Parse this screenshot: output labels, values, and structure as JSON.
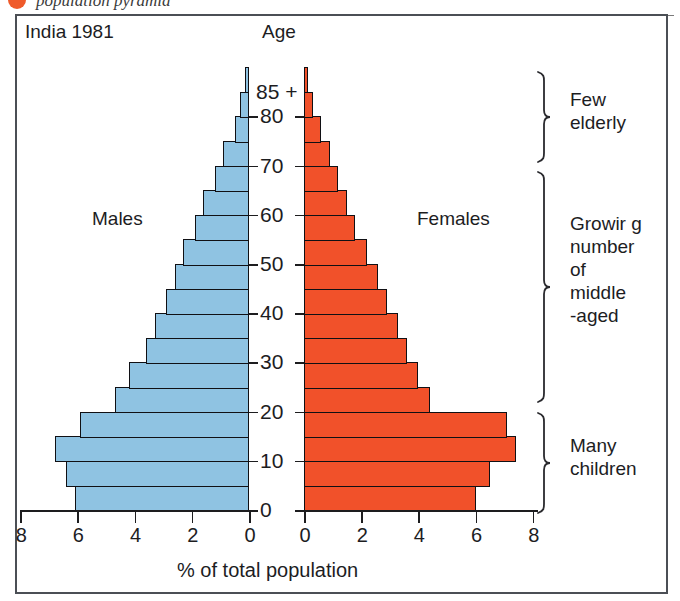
{
  "top_caption": {
    "text": "population pyramid",
    "bullet_icon": "orange-circle-bullet"
  },
  "figure": {
    "title_left": "India 1981",
    "age_axis_title": "Age",
    "left_series_label": "Males",
    "right_series_label": "Females",
    "x_axis_title": "% of total population"
  },
  "annotations": [
    {
      "id": "few-elderly",
      "text": "Few\nelderly"
    },
    {
      "id": "growing-middle-aged",
      "text": "Growir g\nnumber\nof\nmiddle\n-aged"
    },
    {
      "id": "many-children",
      "text": "Many\nchildren"
    }
  ],
  "colors": {
    "male_fill": "#8fc3e2",
    "female_fill": "#f1512a",
    "outline": "#101014",
    "frame": "#4b4f55",
    "bullet": "#ef5a2a"
  },
  "chart_data": {
    "type": "bar",
    "subtype": "population-pyramid",
    "title": "India 1981",
    "xlabel": "% of total population",
    "ylabel": "Age",
    "xlim_left": [
      8,
      0
    ],
    "xlim_right": [
      0,
      8
    ],
    "x_ticks_left": [
      "8",
      "6",
      "4",
      "2",
      "0"
    ],
    "x_ticks_right": [
      "0",
      "2",
      "4",
      "6",
      "8"
    ],
    "y_tick_labels": [
      "0",
      "10",
      "20",
      "30",
      "40",
      "50",
      "60",
      "70",
      "80",
      "85 +"
    ],
    "grid": false,
    "legend_position": "inline",
    "categories": [
      "0-4",
      "5-9",
      "10-14",
      "15-19",
      "20-24",
      "25-29",
      "30-34",
      "35-39",
      "40-44",
      "45-49",
      "50-54",
      "55-59",
      "60-64",
      "65-69",
      "70-74",
      "75-79",
      "80-84",
      "85+"
    ],
    "series": [
      {
        "name": "Males",
        "color": "#8fc3e2",
        "values": [
          6.1,
          6.4,
          6.8,
          5.9,
          4.7,
          4.2,
          3.6,
          3.3,
          2.9,
          2.6,
          2.3,
          1.9,
          1.6,
          1.2,
          0.9,
          0.5,
          0.3,
          0.15
        ]
      },
      {
        "name": "Females",
        "color": "#f1512a",
        "values": [
          6.0,
          6.5,
          7.4,
          7.1,
          4.4,
          4.0,
          3.6,
          3.3,
          2.9,
          2.6,
          2.2,
          1.8,
          1.5,
          1.2,
          0.9,
          0.6,
          0.3,
          0.15
        ]
      }
    ]
  }
}
